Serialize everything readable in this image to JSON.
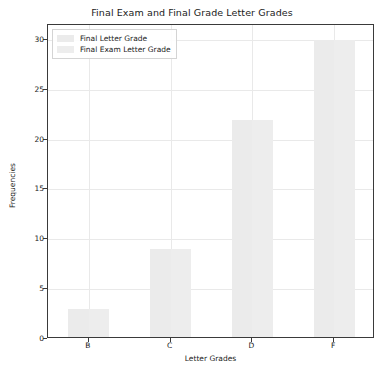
{
  "chart_data": {
    "type": "bar",
    "title": "Final Exam and Final Grade Letter Grades",
    "xlabel": "Letter Grades",
    "ylabel": "Frequencies",
    "categories": [
      "B",
      "C",
      "D",
      "F"
    ],
    "series": [
      {
        "name": "Final Letter Grade",
        "color": "#ebebeb",
        "values": [
          3,
          9,
          22,
          30
        ]
      },
      {
        "name": "Final Exam Letter Grade",
        "color": "#ededed",
        "values": [
          3,
          9,
          22,
          30
        ]
      }
    ],
    "values": [
      3,
      9,
      22,
      30
    ],
    "ylim": [
      0,
      31.5
    ],
    "yticks": [
      0,
      5,
      10,
      15,
      20,
      25,
      30
    ],
    "ytick_labels": [
      "0",
      "5",
      "10",
      "15",
      "20",
      "25",
      "30"
    ],
    "grid": true,
    "legend_position": "upper left"
  },
  "legend": {
    "entries": [
      {
        "label": "Final Letter Grade",
        "swatch": "#ebebeb"
      },
      {
        "label": "Final Exam Letter Grade",
        "swatch": "#ededed"
      }
    ]
  }
}
